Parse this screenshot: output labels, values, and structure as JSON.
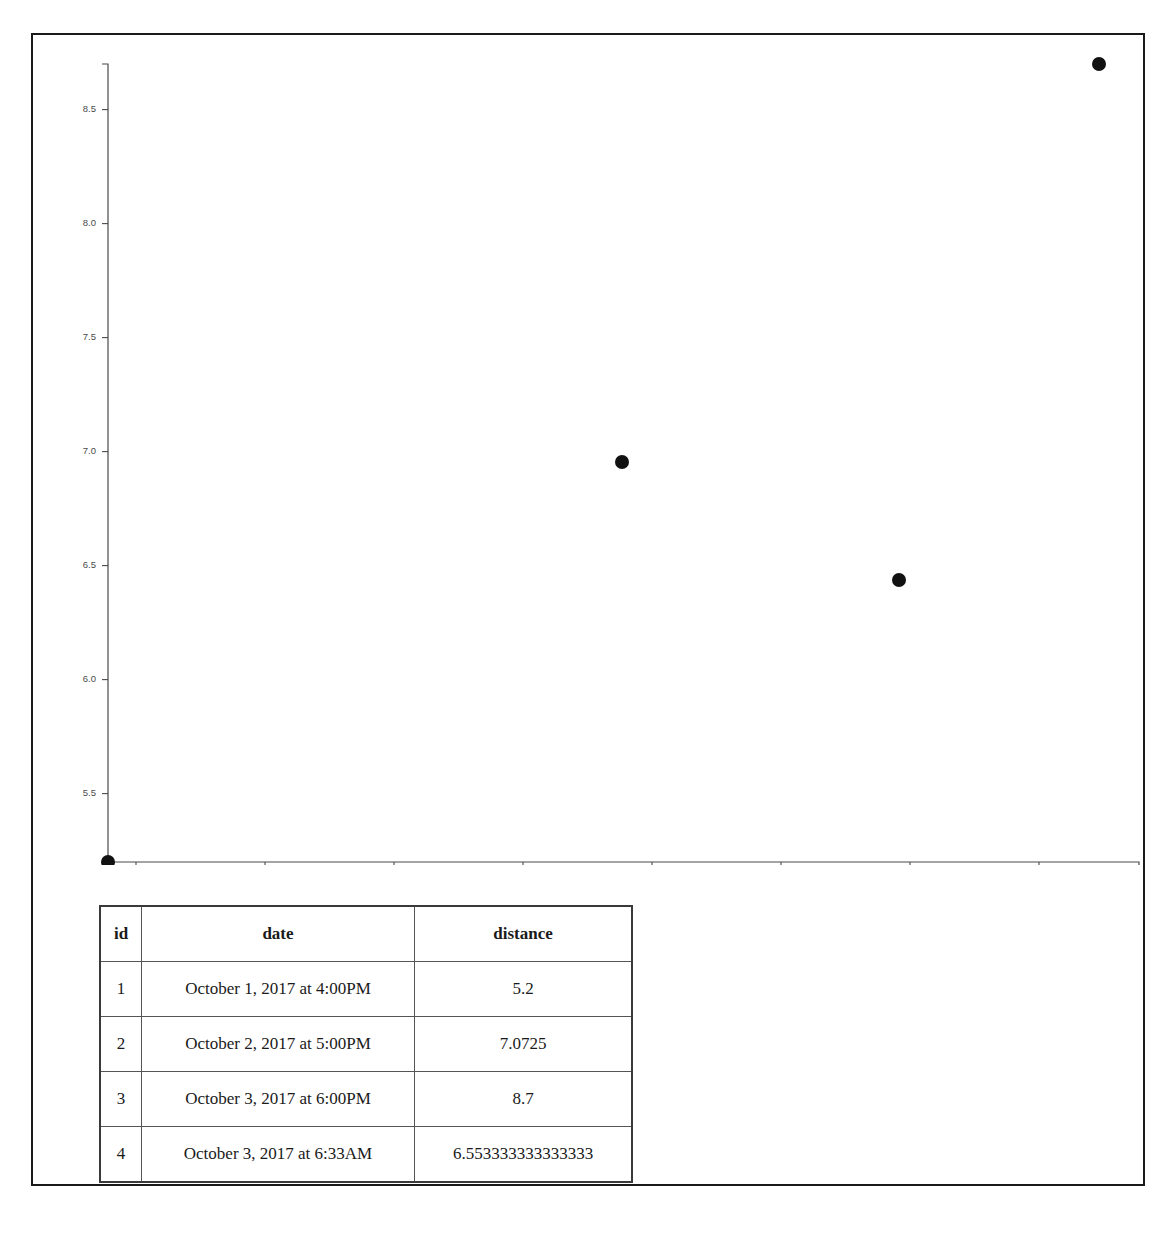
{
  "document": {
    "title": "Distance over time",
    "has_outer_border": true,
    "border_color": "#1a1a1a",
    "background_color": "#ffffff"
  },
  "chart_data": {
    "type": "scatter",
    "title": "",
    "xlabel": "",
    "ylabel": "",
    "grid": false,
    "legend": null,
    "marker_color": "#111111",
    "axis_color": "#4a4a4a",
    "x_type": "datetime",
    "x_tick_labels": [
      "06 PM",
      "Mon 02",
      "06 AM",
      "12 PM",
      "06 PM",
      "Tue 03",
      "06 AM",
      "12 PM",
      "06 PM"
    ],
    "x_tick_positions_px": [
      103,
      232,
      361,
      490,
      619,
      748,
      877,
      1006,
      1131
    ],
    "xlim_labels": [
      "October 1, 2017 at 4:00PM",
      "October 3, 2017 at 6:00PM"
    ],
    "y_tick_labels": [
      "5.5",
      "6.0",
      "6.5",
      "7.0",
      "7.5",
      "8.0",
      "8.5"
    ],
    "y_tick_values": [
      5.5,
      6.0,
      6.5,
      7.0,
      7.5,
      8.0,
      8.5
    ],
    "ylim": [
      5.2,
      8.7
    ],
    "points": [
      {
        "label": "October 1, 2017 at 4:00PM",
        "x_px": 75,
        "y_px": 827,
        "y": 5.2
      },
      {
        "label": "October 2, 2017 at 5:00PM",
        "x_px": 589,
        "y_px": 427,
        "y": 7.0725
      },
      {
        "label": "October 3, 2017 at 6:33AM",
        "x_px": 866,
        "y_px": 545,
        "y": 6.553333333333333
      },
      {
        "label": "October 3, 2017 at 6:00PM",
        "x_px": 1066,
        "y_px": 29,
        "y": 8.7
      }
    ]
  },
  "table": {
    "name": "distance-records",
    "columns": [
      {
        "key": "id",
        "label": "id"
      },
      {
        "key": "date",
        "label": "date"
      },
      {
        "key": "distance",
        "label": "distance"
      }
    ],
    "rows": [
      {
        "id": "1",
        "date": "October 1, 2017 at 4:00PM",
        "distance": "5.2"
      },
      {
        "id": "2",
        "date": "October 2, 2017 at 5:00PM",
        "distance": "7.0725"
      },
      {
        "id": "3",
        "date": "October 3, 2017 at 6:00PM",
        "distance": "8.7"
      },
      {
        "id": "4",
        "date": "October 3, 2017 at 6:33AM",
        "distance": "6.553333333333333"
      }
    ]
  }
}
